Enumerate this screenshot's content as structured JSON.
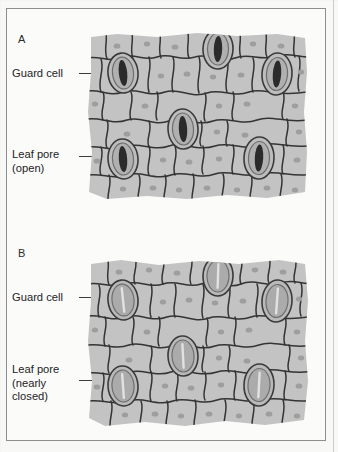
{
  "figure": {
    "background_color": "#f8f8f7",
    "frame_color": "#8e8e8e",
    "cell_fill": "#c3c3c3",
    "cell_fill_light": "#cccccc",
    "cell_outline": "#343434",
    "nucleus_color": "#9e9e9e",
    "guard_outer": "#6e6e6e",
    "guard_inner": "#b6b6b6",
    "pore_open_color": "#2b2b2b",
    "pore_closed_color": "#e2e2e2"
  },
  "panels": [
    {
      "id": "A",
      "letter": "A",
      "state": "open",
      "callouts": [
        {
          "name": "guard-cell",
          "text": "Guard cell",
          "top": 66,
          "left": 11
        },
        {
          "name": "leaf-pore",
          "text": "Leaf pore\n(open)",
          "top": 147,
          "left": 11
        }
      ],
      "stomata": [
        {
          "cx": 36,
          "cy": 41,
          "rx": 15,
          "ry": 20,
          "rot": -6
        },
        {
          "cx": 131,
          "cy": 17,
          "rx": 15,
          "ry": 20,
          "rot": 2
        },
        {
          "cx": 190,
          "cy": 42,
          "rx": 15,
          "ry": 21,
          "rot": 4
        },
        {
          "cx": 96,
          "cy": 97,
          "rx": 15,
          "ry": 20,
          "rot": -3
        },
        {
          "cx": 36,
          "cy": 127,
          "rx": 15,
          "ry": 20,
          "rot": -4
        },
        {
          "cx": 172,
          "cy": 126,
          "rx": 15,
          "ry": 21,
          "rot": 3
        }
      ]
    },
    {
      "id": "B",
      "letter": "B",
      "state": "nearly closed",
      "callouts": [
        {
          "name": "guard-cell",
          "text": "Guard cell",
          "top": 74,
          "left": 11
        },
        {
          "name": "leaf-pore",
          "text": "Leaf pore\n(nearly\nclosed)",
          "top": 146,
          "left": 11
        }
      ],
      "stomata": [
        {
          "cx": 36,
          "cy": 41,
          "rx": 15,
          "ry": 20,
          "rot": -6
        },
        {
          "cx": 131,
          "cy": 17,
          "rx": 15,
          "ry": 20,
          "rot": 2
        },
        {
          "cx": 190,
          "cy": 42,
          "rx": 15,
          "ry": 21,
          "rot": 4
        },
        {
          "cx": 96,
          "cy": 97,
          "rx": 15,
          "ry": 20,
          "rot": -3
        },
        {
          "cx": 36,
          "cy": 127,
          "rx": 15,
          "ry": 20,
          "rot": -4
        },
        {
          "cx": 172,
          "cy": 126,
          "rx": 15,
          "ry": 21,
          "rot": 3
        }
      ]
    }
  ],
  "leaders": {
    "a_guard": {
      "left": 78,
      "top": 72,
      "width": 27
    },
    "a_pore": {
      "left": 78,
      "top": 155,
      "width": 27
    },
    "b_guard": {
      "left": 78,
      "top": 292,
      "width": 27
    },
    "b_pore": {
      "left": 78,
      "top": 374,
      "width": 27
    }
  }
}
